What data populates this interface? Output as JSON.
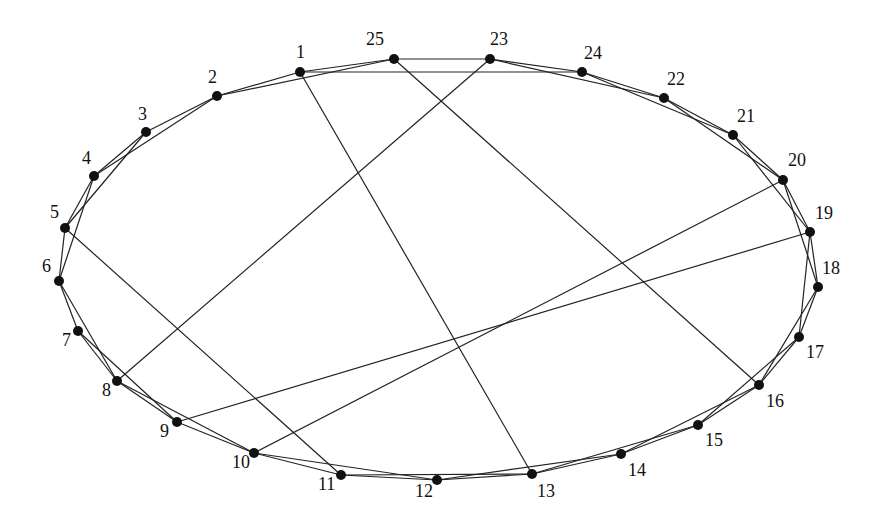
{
  "diagram": {
    "type": "graph",
    "style": {
      "node_color": "#111111",
      "edge_color": "#222222",
      "background": "#ffffff"
    },
    "nodes": [
      {
        "id": "1",
        "x": 300,
        "y": 72,
        "lx": 296,
        "ly": 58
      },
      {
        "id": "2",
        "x": 217,
        "y": 96,
        "lx": 208,
        "ly": 83
      },
      {
        "id": "3",
        "x": 146,
        "y": 132,
        "lx": 138,
        "ly": 120
      },
      {
        "id": "4",
        "x": 94,
        "y": 176,
        "lx": 82,
        "ly": 164
      },
      {
        "id": "5",
        "x": 65,
        "y": 228,
        "lx": 50,
        "ly": 218
      },
      {
        "id": "6",
        "x": 59,
        "y": 281,
        "lx": 42,
        "ly": 272
      },
      {
        "id": "7",
        "x": 78,
        "y": 331,
        "lx": 62,
        "ly": 346
      },
      {
        "id": "8",
        "x": 117,
        "y": 381,
        "lx": 102,
        "ly": 396
      },
      {
        "id": "9",
        "x": 177,
        "y": 422,
        "lx": 160,
        "ly": 437
      },
      {
        "id": "10",
        "x": 254,
        "y": 453,
        "lx": 232,
        "ly": 468
      },
      {
        "id": "11",
        "x": 341,
        "y": 475,
        "lx": 318,
        "ly": 490
      },
      {
        "id": "12",
        "x": 437,
        "y": 480,
        "lx": 415,
        "ly": 497
      },
      {
        "id": "13",
        "x": 532,
        "y": 474,
        "lx": 537,
        "ly": 497
      },
      {
        "id": "14",
        "x": 621,
        "y": 454,
        "lx": 628,
        "ly": 476
      },
      {
        "id": "15",
        "x": 698,
        "y": 425,
        "lx": 705,
        "ly": 446
      },
      {
        "id": "16",
        "x": 759,
        "y": 385,
        "lx": 766,
        "ly": 407
      },
      {
        "id": "17",
        "x": 799,
        "y": 337,
        "lx": 806,
        "ly": 358
      },
      {
        "id": "18",
        "x": 818,
        "y": 287,
        "lx": 822,
        "ly": 274
      },
      {
        "id": "19",
        "x": 810,
        "y": 232,
        "lx": 815,
        "ly": 219
      },
      {
        "id": "20",
        "x": 783,
        "y": 180,
        "lx": 788,
        "ly": 166
      },
      {
        "id": "21",
        "x": 733,
        "y": 135,
        "lx": 737,
        "ly": 122
      },
      {
        "id": "22",
        "x": 664,
        "y": 98,
        "lx": 667,
        "ly": 85
      },
      {
        "id": "24",
        "x": 582,
        "y": 72,
        "lx": 584,
        "ly": 59
      },
      {
        "id": "23",
        "x": 490,
        "y": 59,
        "lx": 490,
        "ly": 45
      },
      {
        "id": "25",
        "x": 394,
        "y": 59,
        "lx": 366,
        "ly": 45
      }
    ],
    "edges": [
      [
        "1",
        "2"
      ],
      [
        "1",
        "25"
      ],
      [
        "1",
        "24"
      ],
      [
        "1",
        "13"
      ],
      [
        "2",
        "25"
      ],
      [
        "2",
        "3"
      ],
      [
        "2",
        "4"
      ],
      [
        "3",
        "4"
      ],
      [
        "3",
        "5"
      ],
      [
        "4",
        "5"
      ],
      [
        "4",
        "6"
      ],
      [
        "5",
        "6"
      ],
      [
        "5",
        "11"
      ],
      [
        "6",
        "7"
      ],
      [
        "6",
        "8"
      ],
      [
        "7",
        "8"
      ],
      [
        "7",
        "9"
      ],
      [
        "8",
        "9"
      ],
      [
        "8",
        "10"
      ],
      [
        "8",
        "23"
      ],
      [
        "9",
        "10"
      ],
      [
        "9",
        "19"
      ],
      [
        "10",
        "11"
      ],
      [
        "10",
        "12"
      ],
      [
        "10",
        "20"
      ],
      [
        "11",
        "12"
      ],
      [
        "11",
        "13"
      ],
      [
        "12",
        "13"
      ],
      [
        "12",
        "14"
      ],
      [
        "13",
        "14"
      ],
      [
        "13",
        "15"
      ],
      [
        "14",
        "15"
      ],
      [
        "14",
        "16"
      ],
      [
        "15",
        "16"
      ],
      [
        "15",
        "17"
      ],
      [
        "16",
        "17"
      ],
      [
        "16",
        "18"
      ],
      [
        "16",
        "25"
      ],
      [
        "17",
        "18"
      ],
      [
        "17",
        "19"
      ],
      [
        "18",
        "19"
      ],
      [
        "18",
        "20"
      ],
      [
        "19",
        "20"
      ],
      [
        "19",
        "21"
      ],
      [
        "20",
        "21"
      ],
      [
        "20",
        "22"
      ],
      [
        "21",
        "22"
      ],
      [
        "21",
        "24"
      ],
      [
        "22",
        "24"
      ],
      [
        "22",
        "23"
      ],
      [
        "23",
        "24"
      ],
      [
        "23",
        "25"
      ]
    ]
  }
}
